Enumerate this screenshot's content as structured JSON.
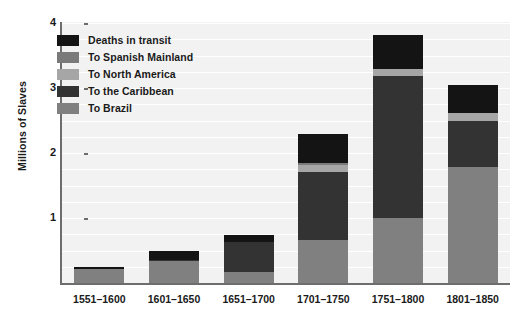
{
  "chart_data": {
    "type": "bar",
    "subtype": "stacked",
    "title": "",
    "xlabel": "",
    "ylabel": "Millions of Slaves",
    "ylim": [
      0,
      4
    ],
    "yticks": [
      1,
      2,
      3,
      4
    ],
    "ytick_labels": [
      "1",
      "2",
      "3",
      "4"
    ],
    "grid": true,
    "legend_position": "upper-left-inside",
    "categories": [
      "1551–1600",
      "1601–1650",
      "1651–1700",
      "1701–1750",
      "1751–1800",
      "1801–1850"
    ],
    "series": [
      {
        "name": "To Brazil",
        "color": "#808080",
        "values": [
          0.22,
          0.34,
          0.17,
          0.66,
          1.0,
          1.78
        ]
      },
      {
        "name": "To the Caribbean",
        "color": "#333333",
        "values": [
          0.0,
          0.01,
          0.46,
          1.05,
          2.18,
          0.72
        ]
      },
      {
        "name": "To North America",
        "color": "#a6a6a6",
        "values": [
          0.0,
          0.0,
          0.0,
          0.11,
          0.12,
          0.11
        ]
      },
      {
        "name": "To Spanish Mainland",
        "color": "#7a7a7a",
        "values": [
          0.0,
          0.0,
          0.0,
          0.03,
          0.0,
          0.0
        ]
      },
      {
        "name": "Deaths in transit",
        "color": "#141414",
        "values": [
          0.03,
          0.15,
          0.11,
          0.45,
          0.51,
          0.44
        ]
      }
    ],
    "totals": [
      0.25,
      0.5,
      0.74,
      2.3,
      3.81,
      3.05
    ]
  },
  "legend": {
    "items": [
      {
        "label": "Deaths in transit",
        "color": "#141414"
      },
      {
        "label": "To Spanish Mainland",
        "color": "#7a7a7a"
      },
      {
        "label": "To North America",
        "color": "#a6a6a6"
      },
      {
        "label": "To the Caribbean",
        "color": "#333333"
      },
      {
        "label": "To Brazil",
        "color": "#808080"
      }
    ]
  },
  "axes": {
    "y_label": "Millions of Slaves",
    "y_ticks": [
      "4",
      "3",
      "2",
      "1"
    ],
    "x_ticks": [
      "1551–1600",
      "1601–1650",
      "1651–1700",
      "1701–1750",
      "1751–1800",
      "1801–1850"
    ]
  },
  "colors": {
    "plot_background": "#f2f2f2",
    "page_background": "#ffffff",
    "gridline": "#ffffff",
    "axis_line": "#6d6d6d",
    "text": "#1a1a1a"
  }
}
